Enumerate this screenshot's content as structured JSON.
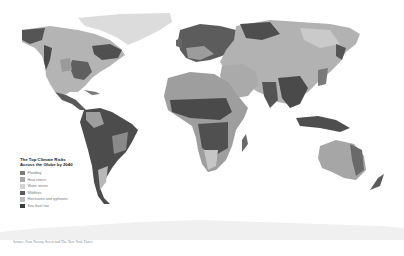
{
  "map": {
    "title_line1": "The Top Climate Risks",
    "title_line2": "Across the Globe by 2040",
    "legend": [
      {
        "label": "Flooding",
        "color": "#7a7a7a"
      },
      {
        "label": "Heat stress",
        "color": "#a8a8a8"
      },
      {
        "label": "Water stress",
        "color": "#d4d4d4"
      },
      {
        "label": "Wildfires",
        "color": "#5a5a5a"
      },
      {
        "label": "Hurricanes and typhoons",
        "color": "#bcbcbc"
      },
      {
        "label": "Sea level rise",
        "color": "#3c3c3c"
      }
    ],
    "source": "Source: Four Twenty Seven and The New York Times",
    "colors": {
      "background": "#ffffff",
      "flooding": "#7a7a7a",
      "heat_stress": "#a8a8a8",
      "water_stress": "#d4d4d4",
      "wildfires": "#5a5a5a",
      "hurricanes": "#bcbcbc",
      "sea_level": "#3c3c3c"
    }
  }
}
